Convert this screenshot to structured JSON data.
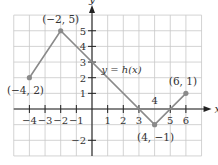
{
  "chart_data": {
    "type": "line",
    "title": "",
    "function_label": "y = h(x)",
    "xlabel": "x",
    "ylabel": "y",
    "xlim": [
      -5,
      7
    ],
    "ylim": [
      -3,
      6
    ],
    "grid": true,
    "x_ticks": [
      -4,
      -3,
      -2,
      -1,
      1,
      2,
      3,
      5,
      6
    ],
    "x_tick_labels": [
      "−4",
      "−3",
      "−2",
      "−1",
      "1",
      "2",
      "3",
      "5",
      "6"
    ],
    "y_ticks": [
      5,
      4,
      3,
      2,
      1,
      -2
    ],
    "y_tick_labels": [
      "5",
      "4",
      "3",
      "2",
      "1",
      "−2"
    ],
    "extra_label": {
      "text": "4",
      "x": 4,
      "y": 0.5
    },
    "series": [
      {
        "name": "h(x)",
        "x": [
          -4,
          -2,
          4,
          6
        ],
        "y": [
          2,
          5,
          -1,
          1
        ]
      }
    ],
    "points": [
      {
        "x": -4,
        "y": 2,
        "label": "(−4, 2)"
      },
      {
        "x": -2,
        "y": 5,
        "label": "(−2, 5)"
      },
      {
        "x": 4,
        "y": -1,
        "label": "(4, −1)"
      },
      {
        "x": 6,
        "y": 1,
        "label": "(6, 1)"
      }
    ],
    "colors": {
      "line": "#8a8a8a",
      "grid": "#c8c8c8",
      "axis": "#222222",
      "point": "#8a8a8a"
    }
  }
}
